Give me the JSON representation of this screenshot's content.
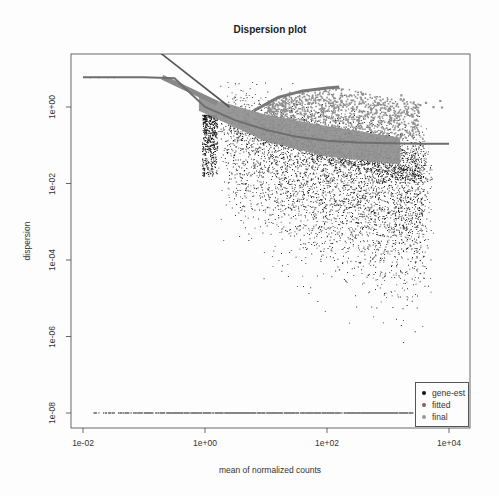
{
  "chart_data": {
    "type": "scatter",
    "title": "Dispersion plot",
    "xlabel": "mean of normalized counts",
    "ylabel": "dispersion",
    "x_scale": "log10",
    "y_scale": "log10",
    "xlim_log10": [
      -2.2,
      4.2
    ],
    "ylim_log10": [
      -8.3,
      1.5
    ],
    "x_ticks": [
      {
        "label": "1e-02",
        "log10": -2
      },
      {
        "label": "1e+00",
        "log10": 0
      },
      {
        "label": "1e+02",
        "log10": 2
      },
      {
        "label": "1e+04",
        "log10": 4
      }
    ],
    "y_ticks": [
      {
        "label": "1e+00",
        "log10": 0
      },
      {
        "label": "1e-02",
        "log10": -2
      },
      {
        "label": "1e-04",
        "log10": -4
      },
      {
        "label": "1e-06",
        "log10": -6
      },
      {
        "label": "1e-08",
        "log10": -8
      }
    ],
    "grid": false,
    "legend_position": "bottomright",
    "series": [
      {
        "name": "gene-est",
        "color": "#111111",
        "description": "per-gene dispersion estimates; dense cloud roughly from 1e+00 to 1e+04 mean counts, dispersion ~1e-04 to 1e+00; floor of points at 1e-08 for zero/low-dispersion genes"
      },
      {
        "name": "fitted",
        "color": "#b04040",
        "description": "fitted dispersion trend curve"
      },
      {
        "name": "final",
        "color": "#6e8fb8",
        "description": "final (shrunken) dispersion estimates"
      }
    ],
    "fitted_curve": [
      {
        "x": -2.0,
        "y": 0.78
      },
      {
        "x": -1.0,
        "y": 0.78
      },
      {
        "x": -0.5,
        "y": 0.75
      },
      {
        "x": 0.0,
        "y": 0.0
      },
      {
        "x": 0.5,
        "y": -0.35
      },
      {
        "x": 1.0,
        "y": -0.6
      },
      {
        "x": 1.5,
        "y": -0.78
      },
      {
        "x": 2.0,
        "y": -0.88
      },
      {
        "x": 2.5,
        "y": -0.93
      },
      {
        "x": 3.0,
        "y": -0.95
      },
      {
        "x": 3.5,
        "y": -0.96
      },
      {
        "x": 4.0,
        "y": -0.96
      }
    ],
    "steep_line": [
      {
        "x": -0.8,
        "y": 1.5
      },
      {
        "x": 0.4,
        "y": 0.0
      }
    ],
    "final_band": {
      "x_range": [
        -0.1,
        3.2
      ],
      "upper": [
        {
          "x": -0.1,
          "y": 0.3
        },
        {
          "x": 1.0,
          "y": -0.2
        },
        {
          "x": 2.0,
          "y": -0.5
        },
        {
          "x": 3.2,
          "y": -0.8
        }
      ],
      "lower": [
        {
          "x": -0.1,
          "y": -0.1
        },
        {
          "x": 1.0,
          "y": -0.9
        },
        {
          "x": 2.0,
          "y": -1.3
        },
        {
          "x": 3.2,
          "y": -1.5
        }
      ]
    },
    "final_upper_arc": [
      {
        "x": 0.8,
        "y": -0.1
      },
      {
        "x": 1.2,
        "y": 0.25
      },
      {
        "x": 1.6,
        "y": 0.42
      },
      {
        "x": 2.0,
        "y": 0.5
      },
      {
        "x": 2.2,
        "y": 0.52
      }
    ],
    "gene_est_cloud": {
      "center_x": [
        0.3,
        3.6
      ],
      "upper_y": [
        0.2,
        -0.9
      ],
      "lower_y": [
        -2.5,
        -4.5
      ]
    },
    "zero_floor_y_log10": -8,
    "zero_floor_x_range": [
      -1.9,
      3.4
    ]
  },
  "legend": {
    "items": [
      {
        "label": "gene-est",
        "color": "#111111"
      },
      {
        "label": "fitted",
        "color": "#b04040"
      },
      {
        "label": "final",
        "color": "#6e8fb8"
      }
    ]
  },
  "plot_area": {
    "left": 71,
    "top": 54,
    "right": 470,
    "bottom": 428
  }
}
